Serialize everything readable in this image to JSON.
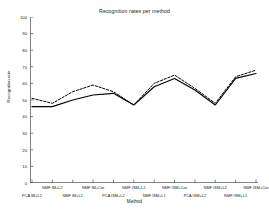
{
  "chart_data": {
    "type": "line",
    "title": "Recognition rates per method",
    "xlabel": "Method",
    "ylabel": "Recognition rate",
    "ylim": [
      0,
      100
    ],
    "yticks": [
      0,
      10,
      20,
      30,
      40,
      50,
      60,
      70,
      80,
      90,
      100
    ],
    "grid": false,
    "legend": "none",
    "categories": [
      "PCA IM+L2",
      "NMF IM+L2",
      "NMF IM+L1",
      "NMF IM+Cor",
      "PCA ISM+L2",
      "NMF ISM+L2",
      "NMF ISM+L1",
      "NMF ISM+Cor",
      "PCA ISM+L2",
      "NMF ISM+L2",
      "NMF ISM+L1",
      "NMF ISM+Cor"
    ],
    "series": [
      {
        "name": "solid",
        "style": "solid",
        "color": "#000000",
        "values": [
          46,
          46,
          50,
          53,
          54,
          47,
          58,
          63,
          56,
          47,
          63,
          66
        ]
      },
      {
        "name": "dashed",
        "style": "dashed",
        "color": "#000000",
        "values": [
          51,
          48,
          55,
          59,
          55,
          47,
          60,
          65,
          57,
          48,
          64,
          68
        ]
      }
    ]
  },
  "axes": {
    "ytick_labels": [
      "0",
      "10",
      "20",
      "30",
      "40",
      "50",
      "60",
      "70",
      "80",
      "90",
      "100"
    ],
    "xtick_labels_upper": [
      "NMF IM+L2",
      "NMF IM+Cor",
      "NMF ISM+L2",
      "NMF ISM+Cor",
      "NMF ISM+L2",
      "NMF ISM+Cor"
    ],
    "xtick_labels_lower": [
      "PCA IM+L2",
      "NMF IM+L1",
      "PCA ISM+L2",
      "NMF ISM+L1",
      "PCA ISM+L2",
      "NMF ISM+L1"
    ]
  }
}
